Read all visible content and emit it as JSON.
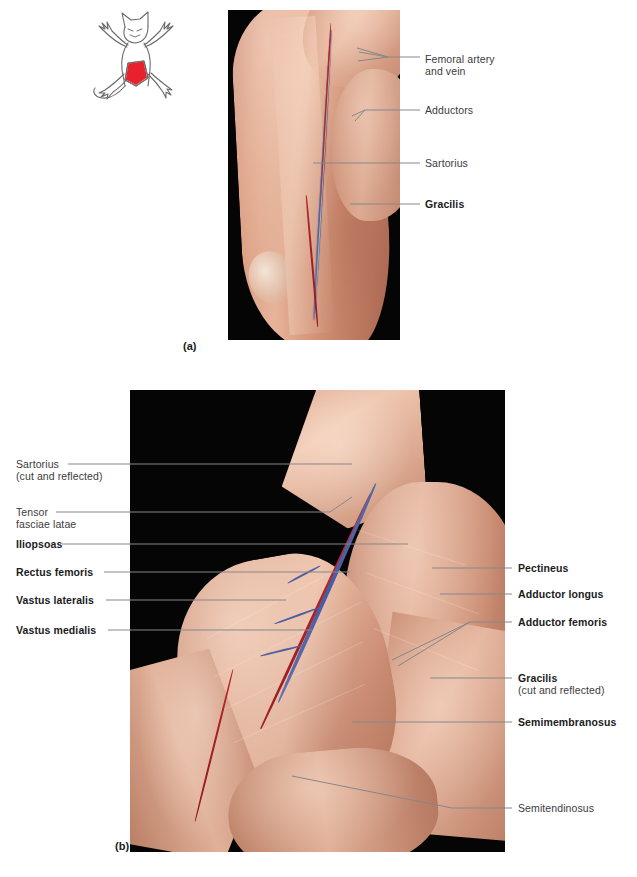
{
  "figure": {
    "panel_a_letter": "(a)",
    "panel_b_letter": "(b)",
    "caption": ""
  },
  "cat_icon": {
    "name": "cat-orientation-diagram",
    "highlight_color": "#e8212e",
    "outline_color": "#6b6b6d"
  },
  "panel_a": {
    "labels": [
      {
        "text": "Femoral artery",
        "text2": "and vein",
        "bold": false
      },
      {
        "text": "Adductors",
        "bold": false
      },
      {
        "text": "Sartorius",
        "bold": false
      },
      {
        "text": "Gracilis",
        "bold": true
      }
    ]
  },
  "panel_b": {
    "labels_left": [
      {
        "text": "Sartorius",
        "sub": "(cut and reflected)",
        "bold": false
      },
      {
        "text": "Tensor",
        "sub": "fasciae latae",
        "bold": false
      },
      {
        "text": "Iliopsoas",
        "bold": true
      },
      {
        "text": "Rectus femoris",
        "bold": true
      },
      {
        "text": "Vastus lateralis",
        "bold": true
      },
      {
        "text": "Vastus medialis",
        "bold": true
      }
    ],
    "labels_right": [
      {
        "text": "Pectineus",
        "bold": true
      },
      {
        "text": "Adductor longus",
        "bold": true
      },
      {
        "text": "Adductor femoris",
        "bold": true
      },
      {
        "text": "Gracilis",
        "sub": "(cut and reflected)",
        "bold": true
      },
      {
        "text": "Semimembranosus",
        "bold": true
      },
      {
        "text": "Semitendinosus",
        "bold": false
      }
    ]
  },
  "colors": {
    "leader_line": "#86878a",
    "label_text": "#3b3b3d",
    "bold_text": "#1b1b1d",
    "photo_background": "#050505",
    "vein_blue": "#4a5ba0",
    "artery_red": "#bf262c"
  }
}
